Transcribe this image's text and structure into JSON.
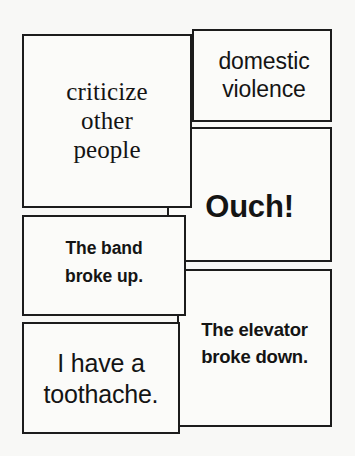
{
  "board": {
    "title": "Speech Bubble Card Grid",
    "background_color": "#f8f8f6",
    "card_fill_color": "#fbfbf9",
    "card_border_color": "#1c1c1c",
    "text_color": "#141414",
    "cards": [
      {
        "id": "criticize",
        "text": "criticize\nother\npeople",
        "lines": [
          "criticize",
          "other",
          "people"
        ]
      },
      {
        "id": "domestic-violence",
        "text": "domestic\nviolence",
        "lines": [
          "domestic",
          "violence"
        ]
      },
      {
        "id": "ouch",
        "text": "Ouch!",
        "lines": [
          "Ouch!"
        ]
      },
      {
        "id": "band-broke-up",
        "text": "The band\nbroke up.",
        "lines": [
          "The band",
          "broke up."
        ]
      },
      {
        "id": "elevator-broke-down",
        "text": "The elevator\nbroke down.",
        "lines": [
          "The elevator",
          "broke down."
        ]
      },
      {
        "id": "toothache",
        "text": "I have a\ntoothache.",
        "lines": [
          "I have a",
          "toothache."
        ]
      }
    ]
  }
}
